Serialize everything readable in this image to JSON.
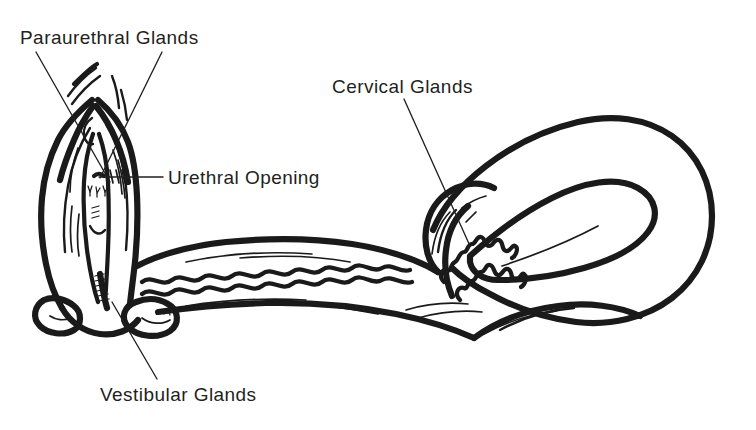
{
  "figure": {
    "background_color": "#ffffff",
    "ink_color": "#1a1a1a",
    "text_color": "#231f20",
    "width": 756,
    "height": 430
  },
  "labels": [
    {
      "id": "paraurethral-glands",
      "text": "Paraurethral Glands",
      "x": 20,
      "y": 44,
      "anchor": "start"
    },
    {
      "id": "urethral-opening",
      "text": "Urethral Opening",
      "x": 168,
      "y": 184,
      "anchor": "start"
    },
    {
      "id": "cervical-glands",
      "text": "Cervical Glands",
      "x": 332,
      "y": 93,
      "anchor": "start"
    },
    {
      "id": "vestibular-glands",
      "text": "Vestibular Glands",
      "x": 100,
      "y": 401,
      "anchor": "start"
    }
  ],
  "leaders": [
    {
      "id": "leader-paraurethral-left",
      "for": "paraurethral-glands",
      "path": "M 36 52 L 110 182"
    },
    {
      "id": "leader-paraurethral-right",
      "for": "paraurethral-glands",
      "path": "M 162 52 L 100 178"
    },
    {
      "id": "leader-urethral-opening",
      "for": "urethral-opening",
      "path": "M 99 177 L 163 177"
    },
    {
      "id": "leader-cervical-glands",
      "for": "cervical-glands",
      "path": "M 404 99 L 470 246"
    },
    {
      "id": "leader-vestibular-glands",
      "for": "vestibular-glands",
      "path": "M 157 379 L 112 302"
    }
  ],
  "structures": [
    {
      "id": "labia-majora-left",
      "name": "Left labium majus outline"
    },
    {
      "id": "labia-majora-right",
      "name": "Right labium majus outline"
    },
    {
      "id": "labia-minora",
      "name": "Labia minora / vestibule"
    },
    {
      "id": "clitoral-hood",
      "name": "Clitoral hood folds"
    },
    {
      "id": "urethral-opening-mark",
      "name": "Urethral opening"
    },
    {
      "id": "paraurethral-gland-marks",
      "name": "Paraurethral gland openings"
    },
    {
      "id": "vaginal-introitus",
      "name": "Vaginal introitus"
    },
    {
      "id": "vestibular-bulb-left",
      "name": "Left vestibular gland"
    },
    {
      "id": "vestibular-bulb-right",
      "name": "Right vestibular gland"
    },
    {
      "id": "vaginal-canal",
      "name": "Vaginal canal with rugae"
    },
    {
      "id": "cervix",
      "name": "Cervix"
    },
    {
      "id": "cervical-gland-squiggles",
      "name": "Cervical glands"
    },
    {
      "id": "uterus-body",
      "name": "Uterine body"
    },
    {
      "id": "uterine-cavity",
      "name": "Uterine cavity (endometrium)"
    }
  ]
}
